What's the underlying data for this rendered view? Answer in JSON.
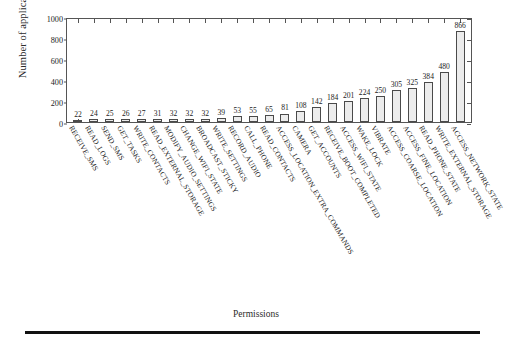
{
  "chart_data": {
    "type": "bar",
    "title": "",
    "xlabel": "Permissions",
    "ylabel": "Number of applications",
    "ylim": [
      0,
      1000
    ],
    "yticks": [
      0,
      200,
      400,
      600,
      800,
      1000
    ],
    "grid": false,
    "legend": null,
    "categories": [
      "RECEIVE_SMS",
      "READ_LOGS",
      "SEND_SMS",
      "GET_TASKS",
      "WRITE_CONTACTS",
      "READ_EXTERNAL_STORAGE",
      "MODIFY_AUDIO_SETTINGS",
      "CHANGE_WIFI_STATE",
      "BROADCAST_STICKY",
      "WRITE_SETTINGS",
      "RECORD_AUDIO",
      "CALL_PHONE",
      "READ_CONTACTS",
      "ACCESS_LOCATION_EXTRA_COMMANDS",
      "CAMERA",
      "GET_ACCOUNTS",
      "RECEIVE_BOOT_COMPLETED",
      "ACCESS_WIFI_STATE",
      "WAKE_LOCK",
      "VIBRATE",
      "ACCESS_COARSE_LOCATION",
      "ACCESS_FINE_LOCATION",
      "READ_PHONE_STATE",
      "WRITE_EXTERNAL_STORAGE",
      "ACCESS_NETWORK_STATE"
    ],
    "values": [
      22,
      24,
      25,
      26,
      27,
      31,
      32,
      32,
      32,
      39,
      53,
      55,
      65,
      81,
      108,
      142,
      184,
      201,
      224,
      250,
      305,
      325,
      384,
      480,
      866
    ]
  },
  "style": {
    "bar_fill": "#ececec",
    "bar_edge": "#4a4a4a",
    "axis_color": "#555555",
    "text_color": "#1c1c1c",
    "background": "#ffffff",
    "rule_color": "#111111"
  }
}
